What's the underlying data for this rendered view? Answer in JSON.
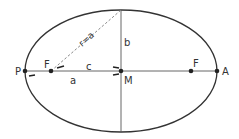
{
  "diagram": {
    "type": "ellipse-geometry",
    "labels": {
      "perihelion": "P",
      "aphelion": "A",
      "focus_left": "F",
      "focus_right": "F",
      "center": "M",
      "semi_major": "a",
      "semi_minor": "b",
      "focal_distance": "c",
      "radius": "r=a"
    },
    "colors": {
      "line": "#333333",
      "dashed": "#888888",
      "background": "#ffffff"
    }
  }
}
